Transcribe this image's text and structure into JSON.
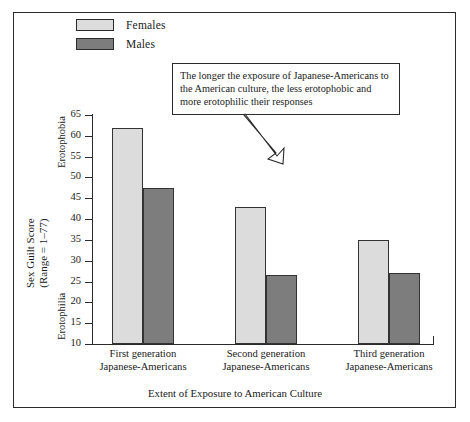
{
  "chart_data": {
    "type": "bar",
    "title": "",
    "xlabel": "Extent of Exposure to American Culture",
    "ylabel": "Sex Guilt Score",
    "ylabel_line2": "(Range = 1–77)",
    "ylim": [
      10,
      65
    ],
    "ytick_step": 5,
    "yticks": [
      65,
      60,
      55,
      50,
      45,
      40,
      35,
      30,
      25,
      20,
      15,
      10
    ],
    "ytick_labels": [
      "65",
      "60",
      "55",
      "50",
      "45",
      "40",
      "35",
      "30",
      "25",
      "20",
      "15",
      "10"
    ],
    "axis_high_label": "Erotophobia",
    "axis_low_label": "Erotophilia",
    "grid": false,
    "legend_position": "top-left",
    "categories": [
      "First generation\nJapanese-Americans",
      "Second generation\nJapanese-Americans",
      "Third generation\nJapanese-Americans"
    ],
    "category_lines": [
      [
        "First generation",
        "Japanese-Americans"
      ],
      [
        "Second generation",
        "Japanese-Americans"
      ],
      [
        "Third generation",
        "Japanese-Americans"
      ]
    ],
    "series": [
      {
        "name": "Females",
        "color": "#dcdcdc",
        "values": [
          62,
          43,
          35
        ]
      },
      {
        "name": "Males",
        "color": "#7d7d7d",
        "values": [
          47.5,
          26.5,
          27
        ]
      }
    ],
    "annotation": "The longer the exposure of Japanese-Americans to the American culture, the less erotophobic and more erotophilic their responses"
  },
  "legend": {
    "items": [
      {
        "label": "Females",
        "color": "#dcdcdc"
      },
      {
        "label": "Males",
        "color": "#7d7d7d"
      }
    ]
  },
  "annotation": {
    "line1": "The longer the exposure of Japanese-Americans to",
    "line2": "the American culture, the less erotophobic and",
    "line3": "more erotophilic their responses"
  },
  "axes": {
    "y_title_line1": "Sex Guilt Score",
    "y_title_line2": "(Range = 1–77)",
    "y_high": "Erotophobia",
    "y_low": "Erotophilia",
    "x_title": "Extent of Exposure to American Culture"
  },
  "colors": {
    "females": "#dcdcdc",
    "males": "#7d7d7d",
    "outline": "#2b2b2b",
    "background": "#ffffff"
  }
}
